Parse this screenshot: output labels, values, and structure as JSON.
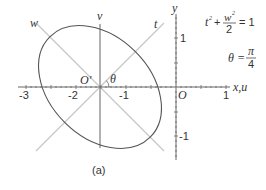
{
  "figure": {
    "caption": "(a)",
    "axes": {
      "x_label": "x,u",
      "y_label": "y",
      "origin_label": "O",
      "x_ticks": [
        "-3",
        "-2",
        "-1",
        "1"
      ],
      "y_ticks": [
        "1",
        "-1"
      ]
    },
    "rotated_axes": {
      "origin_label": "O'",
      "v_label": "v",
      "t_label": "t",
      "w_label": "w",
      "angle_label": "θ"
    },
    "equation": {
      "t_term": "t",
      "t_sup": "2",
      "plus": "+",
      "w_num": "w",
      "w_sup": "2",
      "w_den": "2",
      "rhs": "= 1"
    },
    "angle_eq": {
      "lhs": "θ =",
      "num": "π",
      "den": "4"
    },
    "colors": {
      "axis": "#666666",
      "rotated_axis": "#c8c8c8",
      "ellipse": "#555555"
    }
  }
}
